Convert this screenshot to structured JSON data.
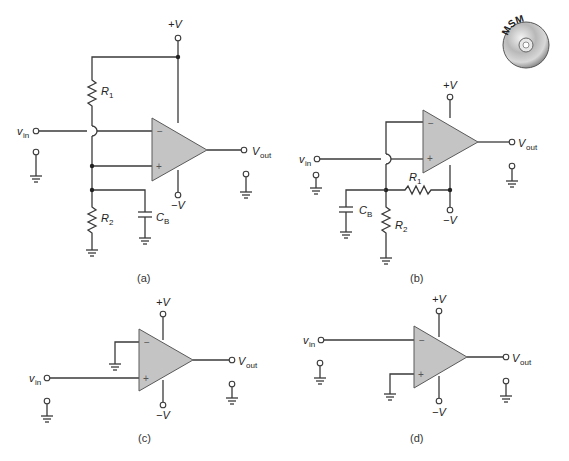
{
  "figure": {
    "badge": {
      "text": "MSM",
      "icon": "cd-disc-icon"
    },
    "circuits": [
      {
        "id": "a",
        "caption": "(a)",
        "labels": {
          "vpos": "+V",
          "vneg": "−V",
          "vin_main": "v",
          "vin_sub": "in",
          "vout_main": "V",
          "vout_sub": "out",
          "r1_main": "R",
          "r1_sub": "1",
          "r2_main": "R",
          "r2_sub": "2",
          "cb_main": "C",
          "cb_sub": "B",
          "inv": "−",
          "noninv": "+"
        }
      },
      {
        "id": "b",
        "caption": "(b)",
        "labels": {
          "vpos": "+V",
          "vneg": "−V",
          "vin_main": "v",
          "vin_sub": "in",
          "vout_main": "V",
          "vout_sub": "out",
          "r1_main": "R",
          "r1_sub": "1",
          "r2_main": "R",
          "r2_sub": "2",
          "cb_main": "C",
          "cb_sub": "B",
          "inv": "−",
          "noninv": "+"
        }
      },
      {
        "id": "c",
        "caption": "(c)",
        "labels": {
          "vpos": "+V",
          "vneg": "−V",
          "vin_main": "v",
          "vin_sub": "in",
          "vout_main": "V",
          "vout_sub": "out",
          "inv": "−",
          "noninv": "+"
        }
      },
      {
        "id": "d",
        "caption": "(d)",
        "labels": {
          "vpos": "+V",
          "vneg": "−V",
          "vin_main": "v",
          "vin_sub": "in",
          "vout_main": "V",
          "vout_sub": "out",
          "inv": "−",
          "noninv": "+"
        }
      }
    ],
    "colors": {
      "opamp_fill": "#c4c4c4",
      "wire": "#3a3a3a",
      "background": "#ffffff"
    }
  }
}
